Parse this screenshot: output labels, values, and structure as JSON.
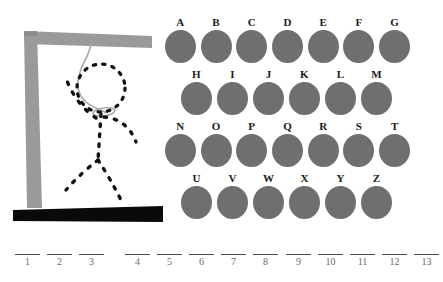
{
  "colors": {
    "background": "#ffffff",
    "gallows": "#9a9a9a",
    "gallows_shadow": "#8c8c8c",
    "base_bar": "#0a0a0a",
    "rope": "#a8a8a8",
    "figure_stroke": "#111111",
    "letter_disc": "#6f6f6f",
    "letter_label": "#1a1a1a",
    "blank_rule": "#4a4a4a",
    "blank_index": "#6a6a6a"
  },
  "drawing": {
    "name": "hangman-gallows",
    "parts": [
      "gallows-post",
      "gallows-beam",
      "gallows-base",
      "rope",
      "noose-knot",
      "figure-head",
      "figure-torso",
      "figure-left-arm",
      "figure-right-arm",
      "figure-left-leg",
      "figure-right-leg"
    ],
    "misses": 11
  },
  "keyboard": {
    "name": "letter-keyboard",
    "rows": [
      {
        "indent": false,
        "letters": [
          "A",
          "B",
          "C",
          "D",
          "E",
          "F",
          "G"
        ]
      },
      {
        "indent": true,
        "letters": [
          "H",
          "I",
          "J",
          "K",
          "L",
          "M"
        ]
      },
      {
        "indent": false,
        "letters": [
          "N",
          "O",
          "P",
          "Q",
          "R",
          "S",
          "T"
        ]
      },
      {
        "indent": true,
        "letters": [
          "U",
          "V",
          "W",
          "X",
          "Y",
          "Z"
        ]
      }
    ]
  },
  "answer": {
    "name": "answer-blanks",
    "total_blanks": 13,
    "groups": [
      {
        "left": 14,
        "slots": [
          {
            "index": "1",
            "letter": ""
          },
          {
            "index": "2",
            "letter": ""
          },
          {
            "index": "3",
            "letter": ""
          }
        ]
      },
      {
        "left": 124,
        "slots": [
          {
            "index": "4",
            "letter": ""
          },
          {
            "index": "5",
            "letter": ""
          },
          {
            "index": "6",
            "letter": ""
          },
          {
            "index": "7",
            "letter": ""
          },
          {
            "index": "8",
            "letter": ""
          }
        ]
      },
      {
        "left": 285,
        "slots": [
          {
            "index": "9",
            "letter": ""
          },
          {
            "index": "10",
            "letter": ""
          },
          {
            "index": "11",
            "letter": ""
          },
          {
            "index": "12",
            "letter": ""
          },
          {
            "index": "13",
            "letter": ""
          }
        ]
      }
    ]
  }
}
